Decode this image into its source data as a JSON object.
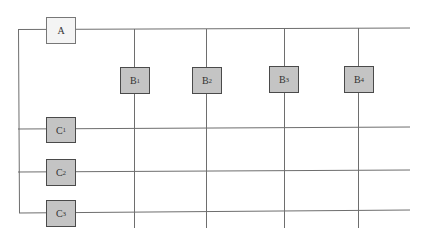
{
  "diagram": {
    "nodes": {
      "A": {
        "label": "A",
        "sub": ""
      },
      "B1": {
        "label": "B",
        "sub": "1"
      },
      "B2": {
        "label": "B",
        "sub": "2"
      },
      "B3": {
        "label": "B",
        "sub": "3"
      },
      "B4": {
        "label": "B",
        "sub": "4"
      },
      "C1": {
        "label": "C",
        "sub": "1"
      },
      "C2": {
        "label": "C",
        "sub": "2"
      },
      "C3": {
        "label": "C",
        "sub": "3"
      }
    },
    "colors": {
      "line": "#6e6e6e",
      "box_light_fill": "#f4f4f4",
      "box_dark_fill": "#c4c4c4",
      "box_border": "#4a4a4a"
    }
  }
}
